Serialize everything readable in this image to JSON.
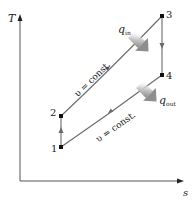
{
  "diagram": {
    "type": "T-s diagram (Otto cycle)",
    "axes": {
      "y_label": "T",
      "x_label": "s"
    },
    "states": [
      {
        "id": "1",
        "label": "1"
      },
      {
        "id": "2",
        "label": "2"
      },
      {
        "id": "3",
        "label": "3"
      },
      {
        "id": "4",
        "label": "4"
      }
    ],
    "processes": [
      {
        "from": "1",
        "to": "2",
        "kind": "vertical (isentropic)"
      },
      {
        "from": "2",
        "to": "3",
        "kind": "constant volume",
        "label": "υ = const."
      },
      {
        "from": "3",
        "to": "4",
        "kind": "vertical (isentropic)"
      },
      {
        "from": "4",
        "to": "1",
        "kind": "constant volume",
        "label": "υ = const."
      }
    ],
    "heat": {
      "in": {
        "symbol": "q",
        "subscript": "in"
      },
      "out": {
        "symbol": "q",
        "subscript": "out"
      }
    },
    "colors": {
      "line": "#6b6b6b",
      "axis": "#555555",
      "point": "#111111",
      "heat_arrow": "#9a9a9a"
    }
  }
}
